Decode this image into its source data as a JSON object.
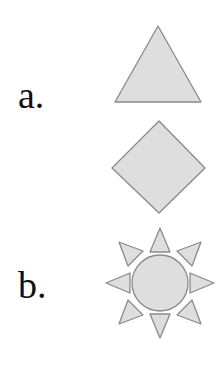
{
  "page": {
    "background_color": "#ffffff",
    "width": 224,
    "height": 379
  },
  "style": {
    "shape_fill": "#dedede",
    "shape_stroke": "#8a8a8a",
    "label_color": "#111111",
    "stroke_width": 1.2
  },
  "items": [
    {
      "label": "a.",
      "shape_name": "triangle",
      "sides": 3,
      "fill": "#dedede",
      "stroke": "#8a8a8a"
    },
    {
      "label": "b.",
      "shape_name": "diamond",
      "sides": 4,
      "fill": "#dedede",
      "stroke": "#8a8a8a"
    },
    {
      "label": "c.",
      "shape_name": "sun",
      "rays": 8,
      "fill": "#dedede",
      "stroke": "#8a8a8a"
    }
  ]
}
